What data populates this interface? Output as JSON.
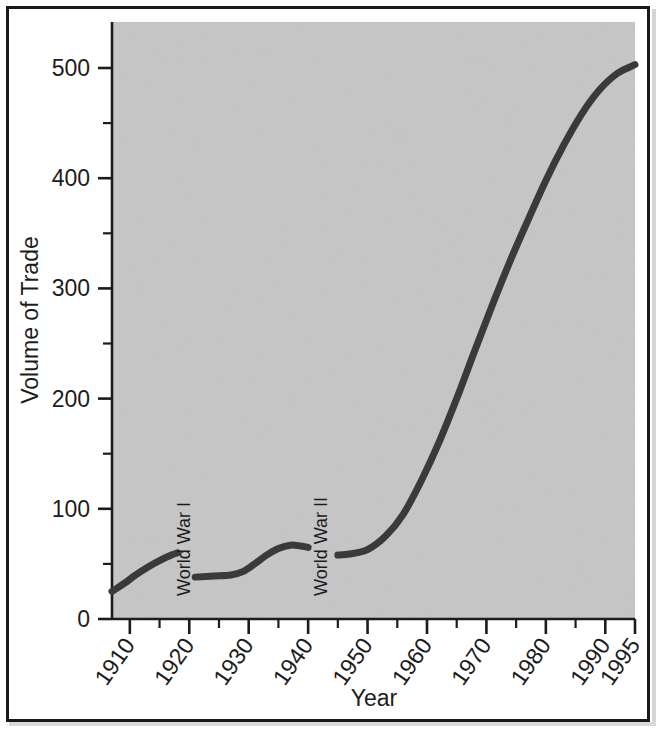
{
  "figure": {
    "background_color": "#ffffff",
    "frame_color": "#1a1a1a",
    "plot_background_color": "#c6c6c6",
    "line_color": "#3a3a3a",
    "text_color": "#1c1c1c"
  },
  "chart_data": {
    "type": "line",
    "title": "",
    "xlabel": "Year",
    "ylabel": "Volume of Trade",
    "xlim": [
      1907,
      1995
    ],
    "ylim": [
      0,
      545
    ],
    "grid": false,
    "legend": "none",
    "x_ticks": [
      1910,
      1920,
      1930,
      1940,
      1950,
      1960,
      1970,
      1980,
      1990,
      1995
    ],
    "x_tick_labels": [
      "1910",
      "1920",
      "1930",
      "1940",
      "1950",
      "1960",
      "1970",
      "1980",
      "1990",
      "1995"
    ],
    "x_minor_ticks": [
      1915,
      1925,
      1935,
      1945,
      1955,
      1965,
      1975,
      1985
    ],
    "y_ticks": [
      0,
      100,
      200,
      300,
      400,
      500
    ],
    "y_tick_labels": [
      "0",
      "100",
      "200",
      "300",
      "400",
      "500"
    ],
    "y_minor_ticks": [
      50,
      150,
      250,
      350,
      450
    ],
    "annotations": [
      {
        "text": "World War I",
        "x": 1919,
        "rotation": -90
      },
      {
        "text": "World War II",
        "x": 1942,
        "rotation": -90
      }
    ],
    "series": [
      {
        "name": "Volume of Trade",
        "segment_label": "pre-war and interwar",
        "x": [
          1907,
          1909,
          1911,
          1913,
          1915,
          1917,
          1918
        ],
        "values": [
          25,
          32,
          40,
          47,
          53,
          58,
          60
        ]
      },
      {
        "name": "Volume of Trade",
        "segment_label": "interwar",
        "x": [
          1921,
          1924,
          1927,
          1929,
          1931,
          1933,
          1935,
          1937,
          1939,
          1940
        ],
        "values": [
          38,
          39,
          40,
          43,
          50,
          58,
          64,
          67,
          66,
          65
        ]
      },
      {
        "name": "Volume of Trade",
        "segment_label": "postwar boom",
        "x": [
          1945,
          1947,
          1950,
          1953,
          1956,
          1959,
          1962,
          1965,
          1968,
          1971,
          1974,
          1977,
          1980,
          1983,
          1986,
          1989,
          1992,
          1995
        ],
        "values": [
          58,
          59,
          63,
          75,
          95,
          125,
          160,
          200,
          243,
          285,
          325,
          362,
          398,
          430,
          458,
          480,
          495,
          503
        ]
      }
    ]
  }
}
